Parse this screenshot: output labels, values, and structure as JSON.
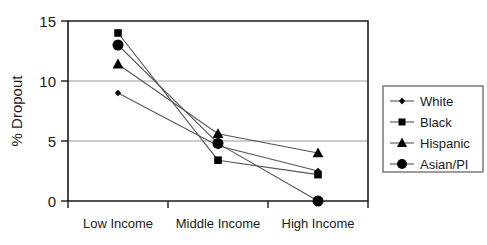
{
  "chart_data": {
    "type": "line",
    "title": "",
    "xlabel": "",
    "ylabel": "% Dropout",
    "categories": [
      "Low Income",
      "Middle Income",
      "High Income"
    ],
    "ylim": [
      0,
      15
    ],
    "yticks": [
      0,
      5,
      10,
      15
    ],
    "ytick_labels": [
      "0",
      "5",
      "10",
      "15"
    ],
    "grid": true,
    "legend_position": "right",
    "series": [
      {
        "name": "White",
        "marker": "diamond",
        "values": [
          9.0,
          4.6,
          2.5
        ]
      },
      {
        "name": "Black",
        "marker": "square",
        "values": [
          14.0,
          3.4,
          2.2
        ]
      },
      {
        "name": "Hispanic",
        "marker": "triangle",
        "values": [
          11.4,
          5.6,
          4.0
        ]
      },
      {
        "name": "Asian/PI",
        "marker": "circle",
        "values": [
          13.0,
          4.8,
          0.0
        ]
      }
    ]
  },
  "axis": {
    "y_label": "% Dropout",
    "y_tick_0": "0",
    "y_tick_1": "5",
    "y_tick_2": "10",
    "y_tick_3": "15",
    "x_cat_0": "Low Income",
    "x_cat_1": "Middle Income",
    "x_cat_2": "High Income"
  },
  "legend": {
    "items": [
      {
        "label": "White",
        "marker": "diamond-marker-icon"
      },
      {
        "label": "Black",
        "marker": "square-marker-icon"
      },
      {
        "label": "Hispanic",
        "marker": "triangle-marker-icon"
      },
      {
        "label": "Asian/PI",
        "marker": "circle-marker-icon"
      }
    ]
  },
  "colors": {
    "marker": "#000000",
    "line": "#555555",
    "axis": "#1a1a1a",
    "grid": "#9a9a9a",
    "background": "#ffffff"
  }
}
